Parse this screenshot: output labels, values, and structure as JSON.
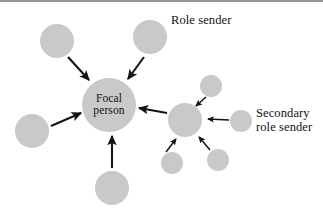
{
  "figure": {
    "background_color": "#ffffff",
    "node_fill_color": "#c9c9c9",
    "arrow_color": "#141414",
    "text_color": "#111111"
  },
  "focal": {
    "label_line1": "Focal",
    "label_line2": "person",
    "cx": 109,
    "cy": 105,
    "r": 27
  },
  "annotations": {
    "role_sender": "Role sender",
    "secondary_role_sender_line1": "Secondary",
    "secondary_role_sender_line2": "role sender"
  },
  "role_senders": [
    {
      "name": "role-sender-upper-left",
      "cx": 57,
      "cy": 41,
      "r": 17
    },
    {
      "name": "role-sender-upper-right",
      "cx": 150,
      "cy": 37,
      "r": 17
    },
    {
      "name": "role-sender-left",
      "cx": 32,
      "cy": 131,
      "r": 17
    },
    {
      "name": "role-sender-bottom",
      "cx": 112,
      "cy": 188,
      "r": 17
    },
    {
      "name": "role-sender-hub-right",
      "cx": 185,
      "cy": 120,
      "r": 17
    }
  ],
  "secondary_role_senders": [
    {
      "name": "secondary-top",
      "cx": 211,
      "cy": 86,
      "r": 11
    },
    {
      "name": "secondary-right",
      "cx": 241,
      "cy": 121,
      "r": 11
    },
    {
      "name": "secondary-bottom-left",
      "cx": 172,
      "cy": 163,
      "r": 11
    },
    {
      "name": "secondary-bottom-right",
      "cx": 218,
      "cy": 160,
      "r": 11
    }
  ],
  "arrows_to_focal": [
    {
      "name": "arrow-upper-left-to-focal",
      "x1": 68,
      "y1": 57,
      "x2": 89,
      "y2": 80
    },
    {
      "name": "arrow-upper-right-to-focal",
      "x1": 144,
      "y1": 57,
      "x2": 128,
      "y2": 79
    },
    {
      "name": "arrow-left-to-focal",
      "x1": 51,
      "y1": 126,
      "x2": 81,
      "y2": 113
    },
    {
      "name": "arrow-bottom-to-focal",
      "x1": 112,
      "y1": 168,
      "x2": 112,
      "y2": 136
    },
    {
      "name": "arrow-hub-to-focal",
      "x1": 167,
      "y1": 113,
      "x2": 139,
      "y2": 108
    }
  ],
  "arrows_to_hub": [
    {
      "name": "arrow-secondary-top-to-hub",
      "x1": 206,
      "y1": 97,
      "x2": 196,
      "y2": 106
    },
    {
      "name": "arrow-secondary-right-to-hub",
      "x1": 229,
      "y1": 120,
      "x2": 208,
      "y2": 119
    },
    {
      "name": "arrow-secondary-bottom-left-to-hub",
      "x1": 166,
      "y1": 152,
      "x2": 176,
      "y2": 139
    },
    {
      "name": "arrow-secondary-bottom-right-to-hub",
      "x1": 210,
      "y1": 150,
      "x2": 199,
      "y2": 137
    }
  ]
}
